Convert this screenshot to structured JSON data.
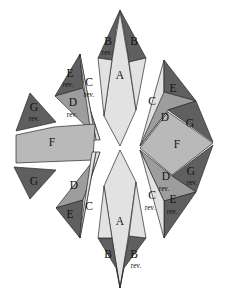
{
  "figure": {
    "background_color": "#ffffff",
    "outline_color": "#2a2a2a",
    "rev_suffix": "rev.",
    "palette": {
      "dark": "#5f5f5f",
      "mid": "#9d9d9d",
      "light": "#e2e2e2",
      "fgray": "#b9b9b9",
      "white": "#ffffff"
    },
    "labels": {
      "A": "A",
      "B": "B",
      "C": "C",
      "D": "D",
      "E": "E",
      "F": "F",
      "G": "G"
    },
    "groups": [
      {
        "name": "top-spindle",
        "pieces": [
          {
            "id": "top-B-left",
            "label": "B",
            "rev": "rev.",
            "tone": "dark"
          },
          {
            "id": "top-B-right",
            "label": "B",
            "rev": "",
            "tone": "dark"
          },
          {
            "id": "top-A",
            "label": "A",
            "rev": "",
            "tone": "light"
          }
        ]
      },
      {
        "name": "upper-left-cluster",
        "pieces": [
          {
            "id": "ul-E",
            "label": "E",
            "rev": "rev.",
            "tone": "dark"
          },
          {
            "id": "ul-D",
            "label": "D",
            "rev": "rev.",
            "tone": "mid"
          },
          {
            "id": "ul-C",
            "label": "C",
            "rev": "rev.",
            "tone": "light"
          }
        ]
      },
      {
        "name": "left-cluster",
        "pieces": [
          {
            "id": "l-G-top",
            "label": "G",
            "rev": "rev.",
            "tone": "dark"
          },
          {
            "id": "l-F",
            "label": "F",
            "rev": "",
            "tone": "fgray"
          },
          {
            "id": "l-G-bottom",
            "label": "G",
            "rev": "",
            "tone": "dark"
          }
        ]
      },
      {
        "name": "lower-left-cluster",
        "pieces": [
          {
            "id": "ll-D",
            "label": "D",
            "rev": "",
            "tone": "mid"
          },
          {
            "id": "ll-E",
            "label": "E",
            "rev": "",
            "tone": "dark"
          },
          {
            "id": "ll-C",
            "label": "C",
            "rev": "",
            "tone": "light"
          }
        ]
      },
      {
        "name": "right-cluster",
        "pieces": [
          {
            "id": "r-C-top",
            "label": "C",
            "rev": "",
            "tone": "light"
          },
          {
            "id": "r-E-top",
            "label": "E",
            "rev": "",
            "tone": "dark"
          },
          {
            "id": "r-D-top",
            "label": "D",
            "rev": "",
            "tone": "mid"
          },
          {
            "id": "r-G-top",
            "label": "G",
            "rev": "",
            "tone": "dark"
          },
          {
            "id": "r-F",
            "label": "F",
            "rev": "",
            "tone": "fgray"
          },
          {
            "id": "r-G-bottom",
            "label": "G",
            "rev": "rev.",
            "tone": "dark"
          },
          {
            "id": "r-D-bottom",
            "label": "D",
            "rev": "rev.",
            "tone": "mid"
          },
          {
            "id": "r-C-bottom",
            "label": "C",
            "rev": "rev.",
            "tone": "light"
          },
          {
            "id": "r-E-bottom",
            "label": "E",
            "rev": "rev.",
            "tone": "dark"
          }
        ]
      },
      {
        "name": "bottom-spindle",
        "pieces": [
          {
            "id": "bot-A",
            "label": "A",
            "rev": "",
            "tone": "light"
          },
          {
            "id": "bot-B-left",
            "label": "B",
            "rev": "",
            "tone": "dark"
          },
          {
            "id": "bot-B-right",
            "label": "B",
            "rev": "rev.",
            "tone": "dark"
          }
        ]
      }
    ]
  }
}
